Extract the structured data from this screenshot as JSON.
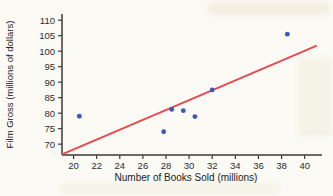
{
  "figure": {
    "background_color": "#fbfaf5",
    "kind": "textbook scatter plot with regression line"
  },
  "chart_data": {
    "type": "scatter",
    "title": "",
    "xlabel": "Number of Books Sold (millions)",
    "ylabel": "Film Gross (millions of dollars)",
    "xlim": [
      19,
      41.5
    ],
    "ylim": [
      66.5,
      112
    ],
    "x_ticks": [
      20,
      22,
      24,
      26,
      28,
      30,
      32,
      34,
      36,
      38,
      40
    ],
    "y_ticks": [
      70,
      75,
      80,
      85,
      90,
      95,
      100,
      105,
      110
    ],
    "grid": false,
    "legend": null,
    "points": [
      {
        "x": 20.5,
        "y": 79
      },
      {
        "x": 27.8,
        "y": 74
      },
      {
        "x": 28.5,
        "y": 81.2
      },
      {
        "x": 29.5,
        "y": 80.8
      },
      {
        "x": 30.5,
        "y": 78.9
      },
      {
        "x": 32.0,
        "y": 87.5
      },
      {
        "x": 38.5,
        "y": 105.5
      }
    ],
    "trend_line": {
      "x1": 19,
      "y1": 66.7,
      "x2": 41,
      "y2": 101.7
    },
    "colors": {
      "point": "#3b58b4",
      "trend_line": "#e8474d",
      "axis": "#3a3a3a",
      "tick_text": "#2c2c2c"
    }
  }
}
